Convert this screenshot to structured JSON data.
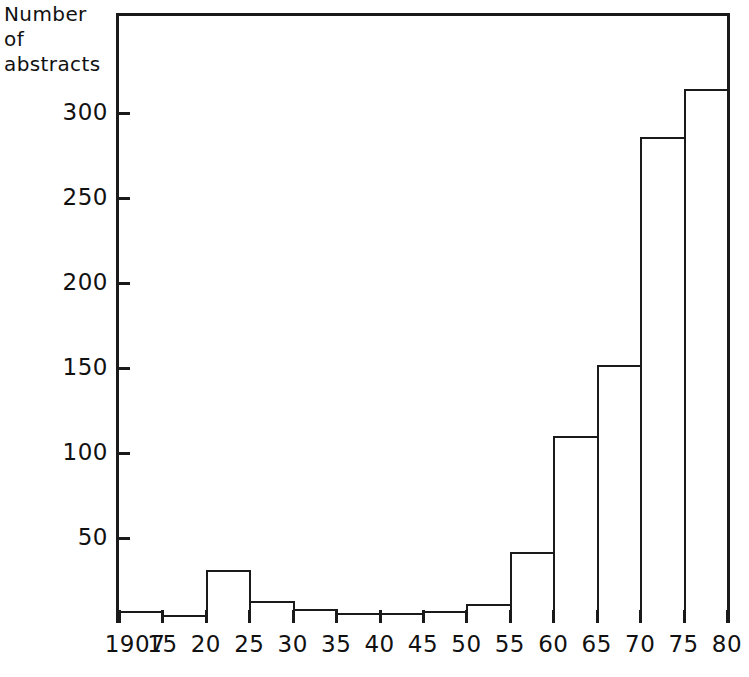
{
  "axis_title": {
    "lines": [
      "Number",
      "of",
      "abstracts"
    ]
  },
  "colors": {
    "ink": "#1a1a1a",
    "background": "#ffffff",
    "bar_fill": "#ffffff",
    "bar_stroke": "#1a1a1a"
  },
  "chart_data": {
    "type": "bar",
    "title": "",
    "subtitle": "",
    "xlabel": "",
    "ylabel": "Number of abstracts",
    "grid": false,
    "legend": null,
    "xlim": [
      1907,
      1980
    ],
    "ylim": [
      0,
      330
    ],
    "x_tick_labels": [
      "1907",
      "15",
      "20",
      "25",
      "30",
      "35",
      "40",
      "45",
      "50",
      "55",
      "60",
      "65",
      "70",
      "75",
      "80"
    ],
    "x_tick_values": [
      1907,
      1915,
      1920,
      1925,
      1930,
      1935,
      1940,
      1945,
      1950,
      1955,
      1960,
      1965,
      1970,
      1975,
      1980
    ],
    "y_tick_labels": [
      "50",
      "100",
      "150",
      "200",
      "250",
      "300"
    ],
    "y_tick_values": [
      50,
      100,
      150,
      200,
      250,
      300
    ],
    "categories": [
      "1907-15",
      "15-20",
      "20-25",
      "25-30",
      "30-35",
      "35-40",
      "40-45",
      "45-50",
      "50-55",
      "55-60",
      "60-65",
      "65-70",
      "70-75",
      "75-80"
    ],
    "bin_edges": [
      1907,
      1915,
      1920,
      1925,
      1930,
      1935,
      1940,
      1945,
      1950,
      1955,
      1960,
      1965,
      1970,
      1975,
      1980
    ],
    "values": [
      7,
      5,
      31,
      13,
      8,
      6,
      6,
      7,
      11,
      42,
      110,
      152,
      286,
      314
    ]
  }
}
